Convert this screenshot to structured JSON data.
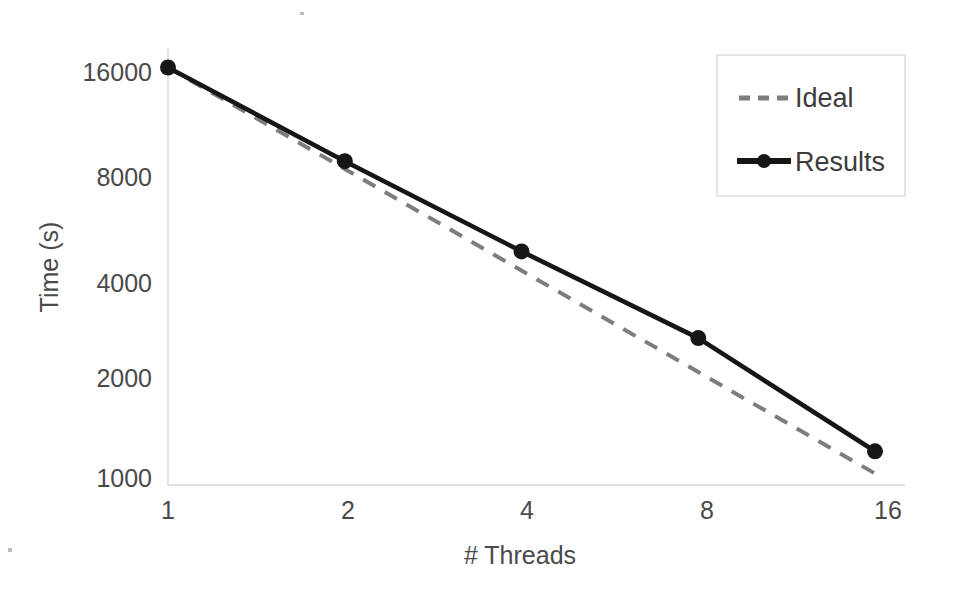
{
  "chart_data": {
    "type": "line",
    "title": "",
    "xlabel": "# Threads",
    "ylabel": "Time (s)",
    "xscale": "log2",
    "yscale": "log2",
    "x": [
      1,
      2,
      4,
      8,
      16
    ],
    "xticklabels": [
      "1",
      "2",
      "4",
      "8",
      "16"
    ],
    "yticks": [
      1000,
      2000,
      4000,
      8000,
      16000
    ],
    "yticklabels": [
      "1000",
      "2000",
      "4000",
      "8000",
      "16000"
    ],
    "ylim": [
      900,
      17800
    ],
    "xlim": [
      1,
      16
    ],
    "grid": false,
    "legend_position": "top-right",
    "series": [
      {
        "name": "Ideal",
        "style": "dashed",
        "color": "#7d7d7d",
        "markers": false,
        "values": [
          16500,
          8250,
          4125,
          2063,
          1031
        ]
      },
      {
        "name": "Results",
        "style": "solid",
        "color": "#161616",
        "markers": true,
        "values": [
          16500,
          8700,
          4700,
          2600,
          1200
        ]
      }
    ]
  },
  "axes": {
    "y_title": "Time (s)",
    "x_title": "# Threads",
    "y_tick_labels": [
      "16000",
      "8000",
      "4000",
      "2000",
      "1000"
    ],
    "x_tick_labels": [
      "1",
      "2",
      "4",
      "8",
      "16"
    ]
  },
  "legend": {
    "entries": [
      {
        "label": "Ideal",
        "marker": "dashed-line"
      },
      {
        "label": "Results",
        "marker": "solid-line-with-dot"
      }
    ]
  }
}
